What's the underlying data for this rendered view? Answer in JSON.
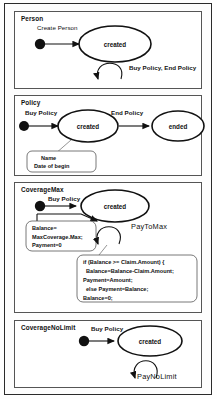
{
  "diagram": {
    "type": "uml-state-machine-collection",
    "sections": [
      {
        "id": "person",
        "title": "Person",
        "initial_transition_label": "Create Person",
        "states": [
          "created"
        ],
        "self_transition_label": "Buy Policy, End Policy",
        "notes": []
      },
      {
        "id": "policy",
        "title": "Policy",
        "initial_transition_label": "Buy Policy",
        "states": [
          "created",
          "ended"
        ],
        "transition_label": "End Policy",
        "notes": [
          {
            "lines": [
              "Name",
              "Date of begin"
            ]
          }
        ]
      },
      {
        "id": "coveragemax",
        "title": "CoverageMax",
        "initial_transition_label": "Buy Policy",
        "states": [
          "created"
        ],
        "self_transition_label": "PayToMax",
        "notes": [
          {
            "lines": [
              "Balance=",
              "MaxCoverage.Max;",
              "Payment=0"
            ]
          },
          {
            "lines": [
              "if (Balance >= Claim.Amount) {",
              "Balance=Balance-Claim.Amount;",
              "Payment=Amount;",
              "else  Payment=Balance;",
              "Balance=0;"
            ]
          }
        ]
      },
      {
        "id": "coveragenolimit",
        "title": "CoverageNoLimit",
        "initial_transition_label": "Buy Policy",
        "states": [
          "created"
        ],
        "self_transition_label": "PayNoLimit",
        "notes": []
      }
    ]
  },
  "colors": {
    "frame": "#2b2b2b",
    "section_border": "#555555",
    "stroke": "#111111",
    "note_border": "#555555",
    "background": "#ffffff"
  }
}
